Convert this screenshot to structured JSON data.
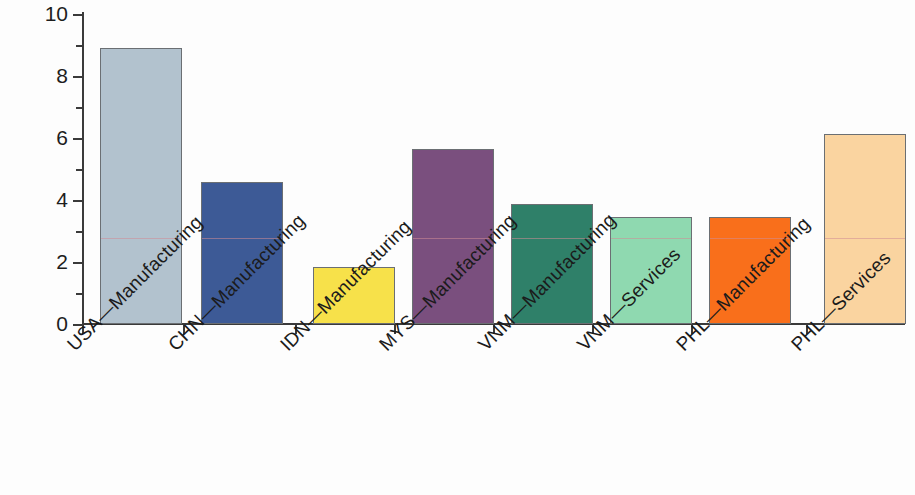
{
  "chart_data": {
    "type": "bar",
    "title": "",
    "subtitle": "",
    "xlabel": "",
    "ylabel": "",
    "ylim": [
      0,
      10
    ],
    "y_ticks": [
      0,
      2,
      4,
      6,
      8,
      10
    ],
    "y_tick_labels": [
      "0",
      "2",
      "4",
      "6",
      "8",
      "10"
    ],
    "y_minor_ticks": [
      1,
      3,
      5,
      7,
      9
    ],
    "grid": false,
    "legend": "none",
    "categories": [
      "USA—Manufacturing",
      "CHN—Manufacturing",
      "IDN—Manufacturing",
      "MYS—Manufacturing",
      "VNM—Manufacturing",
      "VNM—Services",
      "PHL—Manufacturing",
      "PHL—Services"
    ],
    "values": [
      8.9,
      4.58,
      1.84,
      5.65,
      3.87,
      3.45,
      3.45,
      6.13
    ],
    "colors": [
      "#b2c2ce",
      "#3d5a96",
      "#f7e14a",
      "#7a4f7e",
      "#2f8069",
      "#8fd9b0",
      "#f96f1b",
      "#fad4a0"
    ],
    "bar_edge_color": "#6b6f73",
    "axis_color": "#3a3a3a",
    "background_color": "#fdfdfd",
    "bar_left_px": [
      100,
      201,
      313,
      412,
      511,
      610,
      709,
      824
    ],
    "bar_width_px": 82
  }
}
